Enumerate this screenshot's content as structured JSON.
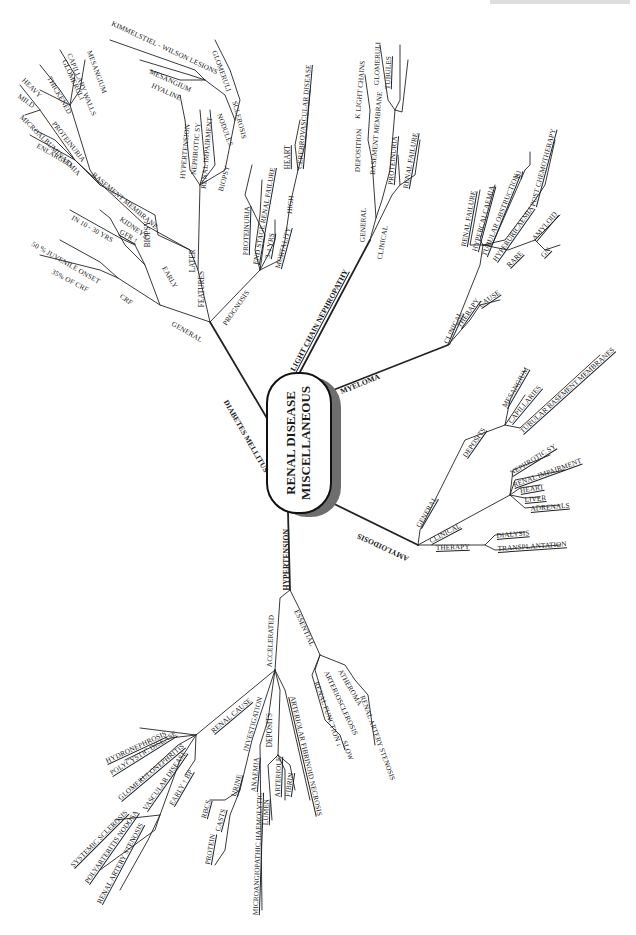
{
  "title": {
    "line1": "RENAL DISEASE",
    "line2": "MISCELLANEOUS"
  },
  "branches": {
    "diabetes": {
      "label": "DIABETES MELLITUS",
      "general": "GENERAL",
      "crf": "CRF",
      "site": "35% OF CRF",
      "juvenile": "50 % JUVENILE ONSET",
      "in_years": "IN 10 - 30 YRS",
      "features": "FEATURES",
      "early": "EARLY",
      "kidneys": "KIDNEYS",
      "gfr": "GFR ↑",
      "enlarged": "ENLARGED",
      "microalb": "MICROALBUMINAEMIA",
      "proteinuria": "PROTEINURIA",
      "mild": "MILD",
      "heavy": "HEAVY",
      "basement": "BASEMENT MEMBRANE",
      "thickened": "THICKENED",
      "glomeruli": "GLOMERULI",
      "capillary": "CAPILLARY WALLS",
      "mesangium": "MESANGIUM",
      "biopsy_early": "BIOPSY",
      "later": "LATER",
      "hypertension": "HYPERTENSION",
      "nephrotic": "NEPHROTIC SY",
      "renal_imp": "RENAL IMPAIRMENT",
      "biopsy": "BIOPSY",
      "nodules": "NODULES",
      "hyaline": "HYALINE",
      "mesangium2": "MESANGIUM",
      "kimmelstiel": "KIMMELSTIEL - WILSON LESIONS",
      "sclerosis": "SCLEROSIS",
      "glomeruli2": "GLOMERULI",
      "prognosis": "PROGNOSIS",
      "prog_proteinuria": "PROTEINURIA",
      "esrf": "END STAGE RENAL FAILURE",
      "yrs": "3-4 YRS",
      "mortality": "MORTALITY",
      "high": "HIGH",
      "heart": "HEART",
      "cerebro": "CEREBROVASCULAR DISEASE"
    },
    "light_chain": {
      "label": "LIGHT CHAIN NEPHROPATHY",
      "general": "GENERAL",
      "deposition": "DEPOSITION",
      "light_chains": "K LIGHT CHAINS",
      "basement": "BASEMENT MEMBRANE",
      "glomeruli": "GLOMERULI",
      "tubules": "TUBULES",
      "clinical": "CLINICAL",
      "proteinuria": "PROTEINURIA",
      "renal_failure": "RENAL FAILURE"
    },
    "myeloma": {
      "label": "MYELOMA",
      "clinical": "CLINICAL",
      "renal_failure": "RENAL FAILURE",
      "hypercalcaemia": "HYPERCALCAEMIA",
      "tubular": "TUBULAR OBSTRUCTION",
      "bj": "BJ",
      "hyperuricaemia": "HYPERURICAEMIA",
      "post_chemo": "POST CHEMOTHERAPY",
      "rare": "RARE",
      "amyloid": "AMYLOID",
      "gn": "GN",
      "therapy": "THERAPY",
      "cause": "CAUSE"
    },
    "amyloidosis": {
      "label": "AMYLOIDOSIS",
      "general": "GENERAL",
      "deposits": "DEPOSITS",
      "mesangium": "MESANGIUM",
      "capillaries": "CAPILLARIES",
      "tubular_bm": "TUBULAR BASEMENT MEMBRANES",
      "clinical": "CLINICAL",
      "nephrotic": "NEPHROTIC SY",
      "renal_imp": "RENAL IMPAIRMENT",
      "heart": "HEART",
      "liver": "LIVER",
      "adrenals": "ADRENALS",
      "therapy": "THERAPY",
      "dialysis": "DIALYSIS",
      "transplant": "TRANSPLANTATION"
    },
    "hypertension": {
      "label": "HYPERTENSION",
      "essential": "ESSENTIAL",
      "atheroma": "ATHEROMA",
      "arteriosclerosis": "ARTERIOSCLEROSIS",
      "renal_function": "RENAL FUNCTION ↓",
      "slow": "SLOW",
      "ras": "RENAL ARTERY STENOSIS",
      "accelerated": "ACCELERATED",
      "renal_cause": "RENAL CAUSE",
      "hydronephrosis": "HYDRONEPHROSIS",
      "polycystic": "POLYCYSTIC DISEASE",
      "glomerulonephritis": "GLOMERULONEPHRITIS",
      "vascular": "VASCULAR DISEASE",
      "systemic": "SYSTEMIC SCLEROSIS",
      "polyarteritis": "POLYARTERITIS NODOSA",
      "ras2": "RENAL ARTERY STENOSIS",
      "early_bp": "EARLY ↑ BP",
      "investigation": "INVESTIGATION",
      "urine": "URINE",
      "rbcs": "RBCS",
      "casts": "CASTS",
      "protein": "PROTEIN",
      "anaemia": "ANAEMIA",
      "micro": "MICROANGIOPATHIC HAEMOLYTIC",
      "deposits": "DEPOSITS",
      "arteriole": "ARTERIOLE",
      "lumen": "LUMEN",
      "fibrin": "FIBRIN",
      "necrosis": "ARTERIOLAR FIBRINOID NECROSIS"
    }
  }
}
